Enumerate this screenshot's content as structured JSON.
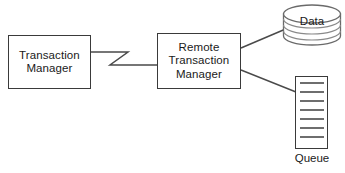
{
  "diagram": {
    "background_color": "#ffffff",
    "stroke_color": "#3a3a3a",
    "text_color": "#1a1a1a",
    "nodes": [
      {
        "id": "transaction-manager",
        "label": "Transaction\nManager",
        "shape": "rectangle"
      },
      {
        "id": "remote-transaction-manager",
        "label": "Remote\nTransaction\nManager",
        "shape": "rectangle"
      },
      {
        "id": "data-store",
        "label": "Data",
        "shape": "stacked-cylinder",
        "layers": 3
      },
      {
        "id": "queue",
        "label": "Queue",
        "shape": "rectangle-with-rows",
        "rows": 7
      }
    ],
    "connectors": [
      {
        "id": "tm-to-rtm",
        "from": "transaction-manager",
        "to": "remote-transaction-manager",
        "style": "zigzag"
      },
      {
        "id": "rtm-to-data",
        "from": "remote-transaction-manager",
        "to": "data-store",
        "style": "straight"
      },
      {
        "id": "rtm-to-queue",
        "from": "remote-transaction-manager",
        "to": "queue",
        "style": "straight"
      }
    ]
  }
}
